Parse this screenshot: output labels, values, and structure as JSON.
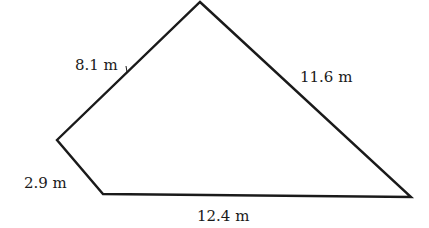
{
  "diagram": {
    "type": "quadrilateral",
    "units": "m",
    "stroke_color": "#1a1a1a",
    "background_color": "#ffffff",
    "vertices": {
      "top": [
        200,
        2
      ],
      "left": [
        57,
        140
      ],
      "bottom_left": [
        103,
        194
      ],
      "right": [
        411,
        197
      ]
    },
    "sides": [
      {
        "id": "top-left",
        "label": "8.1 m",
        "from": "left",
        "to": "top",
        "label_pos": [
          75,
          70
        ]
      },
      {
        "id": "top-right",
        "label": "11.6 m",
        "from": "top",
        "to": "right",
        "label_pos": [
          300,
          82
        ]
      },
      {
        "id": "short-left",
        "label": "2.9 m",
        "from": "left",
        "to": "bottom_left",
        "label_pos": [
          24,
          188
        ]
      },
      {
        "id": "bottom",
        "label": "12.4 m",
        "from": "bottom_left",
        "to": "right",
        "label_pos": [
          197,
          221
        ]
      }
    ]
  }
}
